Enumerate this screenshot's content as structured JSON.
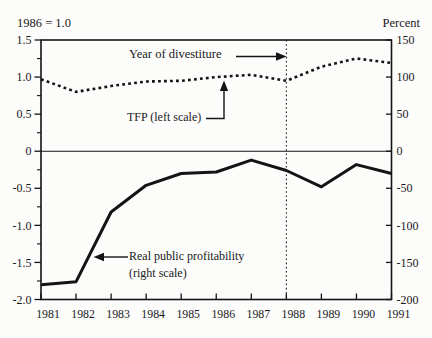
{
  "figure": {
    "top_left_label": "1986 = 1.0",
    "top_right_label": "Percent"
  },
  "annotations": {
    "divestiture_label": "Year of divestiture",
    "tfp_label": "TFP (left scale)",
    "profitability_label_line1": "Real public profitability",
    "profitability_label_line2": "(right scale)"
  },
  "chart_data": {
    "type": "line",
    "x": [
      1981,
      1982,
      1983,
      1984,
      1985,
      1986,
      1987,
      1988,
      1989,
      1990,
      1991
    ],
    "series": [
      {
        "name": "TFP",
        "axis": "left",
        "line_style": "dotted",
        "values": [
          0.97,
          0.8,
          0.88,
          0.94,
          0.95,
          1.0,
          1.03,
          0.95,
          1.14,
          1.25,
          1.19
        ]
      },
      {
        "name": "Real public profitability",
        "axis": "right",
        "line_style": "solid",
        "values": [
          -180,
          -176,
          -82,
          -46,
          -30,
          -28,
          -12,
          -26,
          -48,
          -18,
          -30
        ]
      }
    ],
    "left_axis": {
      "title": "1986 = 1.0",
      "tick_labels": [
        "1.5",
        "1.0",
        "0.5",
        "0",
        "-0.5",
        "-1.0",
        "-1.5",
        "-2.0"
      ],
      "minor_tick_step": 0.25,
      "range": [
        -2.0,
        1.5
      ]
    },
    "right_axis": {
      "title": "Percent",
      "tick_labels": [
        "150",
        "100",
        "50",
        "0",
        "-50",
        "-100",
        "-150",
        "-200"
      ],
      "range": [
        -200,
        150
      ]
    },
    "x_axis": {
      "tick_labels": [
        "1981",
        "1982",
        "1983",
        "1984",
        "1985",
        "1986",
        "1987",
        "1988",
        "1989",
        "1990",
        "1991"
      ]
    },
    "reference_lines": {
      "vertical_dotted_at_year": 1988,
      "horizontal_line_at_left_value": 0
    },
    "grid": "off",
    "legend": "in-plot annotations with arrows"
  },
  "colors": {
    "ink": "#1a1a1a",
    "line": "#141414",
    "background": "#fcfcfb"
  }
}
